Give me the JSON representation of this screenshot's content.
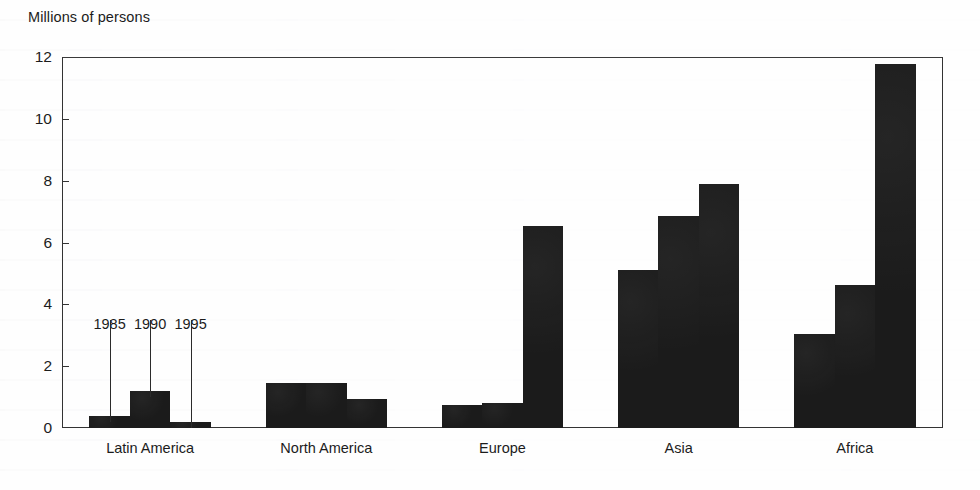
{
  "chart_data": {
    "type": "bar",
    "title": "Millions of persons",
    "subtitle": "",
    "xlabel": "",
    "ylabel": "Millions of persons",
    "categories": [
      "Latin America",
      "North America",
      "Europe",
      "Asia",
      "Africa"
    ],
    "series": [
      {
        "name": "1985",
        "values": [
          0.4,
          1.45,
          0.75,
          5.1,
          3.05
        ]
      },
      {
        "name": "1990",
        "values": [
          1.2,
          1.45,
          0.8,
          6.85,
          4.63
        ]
      },
      {
        "name": "1995",
        "values": [
          0.2,
          0.95,
          6.55,
          7.9,
          11.78
        ]
      }
    ],
    "ylim": [
      0,
      12
    ],
    "yticks": [
      0,
      2,
      4,
      6,
      8,
      10,
      12
    ],
    "ytick_labels": [
      "0",
      "2",
      "4",
      "6",
      "8",
      "10",
      "12"
    ],
    "grid": false,
    "legend": "none",
    "annotations": [
      {
        "text": "1985",
        "target_category": "Latin America",
        "target_series": "1985"
      },
      {
        "text": "1990",
        "target_category": "Latin America",
        "target_series": "1990"
      },
      {
        "text": "1995",
        "target_category": "Latin America",
        "target_series": "1995"
      }
    ],
    "bar_color": "#1a1a1a",
    "axis_color": "#333333",
    "background_color": "#ffffff"
  }
}
